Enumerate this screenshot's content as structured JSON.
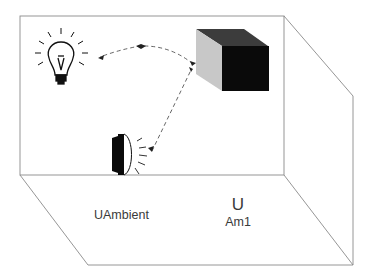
{
  "diagram": {
    "type": "room-lighting-illustration",
    "labels": {
      "ambient": "UAmbient",
      "symbol": "U",
      "subscript": "Am1"
    },
    "elements": [
      {
        "name": "light-bulb",
        "role": "light source"
      },
      {
        "name": "dark-cube",
        "role": "reflecting object"
      },
      {
        "name": "spotlight",
        "role": "light source"
      }
    ],
    "colors": {
      "outline": "#8a8a8a",
      "cube_front": "#0a0a0a",
      "cube_top": "#3c3c3c",
      "cube_side": "#c8c8c8",
      "dashed": "#555555",
      "text": "#3a3a3a"
    }
  }
}
